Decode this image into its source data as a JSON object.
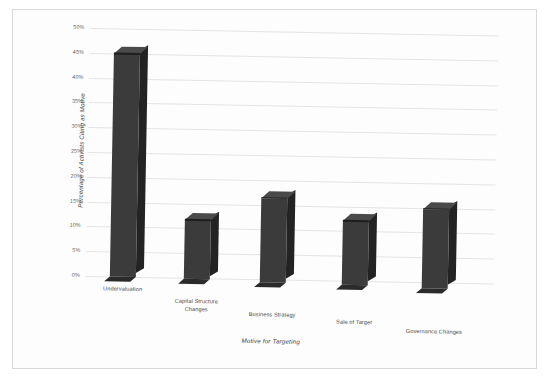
{
  "chart_data": {
    "type": "bar",
    "title": "",
    "subtitle": "",
    "xlabel": "Motive for Targeting",
    "ylabel": "Percentage of Activists Citing as Motive",
    "categories": [
      "Undervaluation",
      "Capital Structure Changes",
      "Business Strategy",
      "Sale of Target",
      "Governance Changes"
    ],
    "values": [
      45,
      12,
      17,
      13,
      16
    ],
    "value_labels": [
      "45%",
      "12%",
      "17%",
      "13%",
      "16%"
    ],
    "ylim": [
      0,
      50
    ],
    "ytick_values": [
      0,
      5,
      10,
      15,
      20,
      25,
      30,
      35,
      40,
      45,
      50
    ],
    "ytick_labels": [
      "0%",
      "5%",
      "10%",
      "15%",
      "20%",
      "25%",
      "30%",
      "35%",
      "40%",
      "45%",
      "50%"
    ],
    "grid": true,
    "legend": false,
    "legend_position": "none",
    "style": "3d-column",
    "bar_color": "#3b3b3b",
    "bar_side_color": "#232323",
    "bar_top_color": "#4a4a4a",
    "gridline_color": "#e4e4e4",
    "background_color": "#fdfdfd",
    "border_color": "#d8d8d8"
  },
  "axis": {
    "y_title": "Percentage of Activists Citing as Motive",
    "x_title": "Motive for Targeting"
  },
  "categories_display": [
    {
      "line1": "Undervaluation",
      "line2": ""
    },
    {
      "line1": "Capital Structure",
      "line2": "Changes"
    },
    {
      "line1": "Business Strategy",
      "line2": ""
    },
    {
      "line1": "Sale of Target",
      "line2": ""
    },
    {
      "line1": "Governance Changes",
      "line2": ""
    }
  ]
}
